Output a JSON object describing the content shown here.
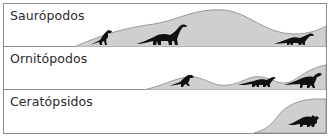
{
  "colors": {
    "hill_fill": "#cfcfcf",
    "hill_stroke": "#9a9a9a",
    "silhouette": "#111111",
    "border": "#8c8c8c"
  },
  "bands": [
    {
      "label": "Saurópodos",
      "silhouettes": [
        "theropod-icon",
        "sauropod-icon",
        "sauropod-icon"
      ]
    },
    {
      "label": "Ornitópodos",
      "silhouettes": [
        "ornithopod-icon",
        "ornithopod-icon",
        "ornithopod-icon"
      ]
    },
    {
      "label": "Ceratópsidos",
      "silhouettes": [
        "triceratops-icon"
      ]
    }
  ]
}
